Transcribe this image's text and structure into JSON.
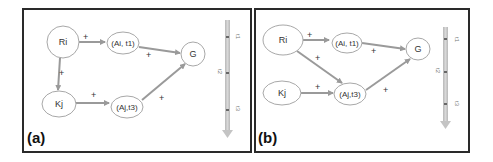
{
  "figure": {
    "panels": [
      {
        "id": "a",
        "label": "(a)",
        "nodes": {
          "ri": "Ri",
          "ai_t1": "(Ai, t1)",
          "g": "G",
          "kj": "Kj",
          "aj_t3": "(Aj,t3)"
        },
        "edges": [
          {
            "from": "Ri",
            "to": "(Ai, t1)",
            "sign": "+"
          },
          {
            "from": "Ri",
            "to": "Kj",
            "sign": "+"
          },
          {
            "from": "(Ai, t1)",
            "to": "G",
            "sign": "+"
          },
          {
            "from": "Kj",
            "to": "(Aj,t3)",
            "sign": "+"
          },
          {
            "from": "(Aj,t3)",
            "to": "G",
            "sign": "+"
          }
        ],
        "timeline": [
          "t1",
          "t2",
          "t3"
        ]
      },
      {
        "id": "b",
        "label": "(b)",
        "nodes": {
          "ri": "Ri",
          "ai_t1": "(Ai, t1)",
          "g": "G",
          "kj": "Kj",
          "aj_t3": "(Aj,t3)"
        },
        "edges": [
          {
            "from": "Ri",
            "to": "(Ai, t1)",
            "sign": "+"
          },
          {
            "from": "Ri",
            "to": "(Aj,t3)",
            "sign": "+"
          },
          {
            "from": "(Ai, t1)",
            "to": "G",
            "sign": "+"
          },
          {
            "from": "Kj",
            "to": "(Aj,t3)",
            "sign": "+"
          },
          {
            "from": "(Aj,t3)",
            "to": "G",
            "sign": "+"
          }
        ],
        "timeline": [
          "t1",
          "t2",
          "t3"
        ]
      }
    ],
    "plus_sign": "+",
    "colors": {
      "arrow": "#9a9a9a",
      "node_stroke": "#a8a8a8",
      "border": "#2a2a2a",
      "timeline": "#c4c4c4"
    }
  }
}
